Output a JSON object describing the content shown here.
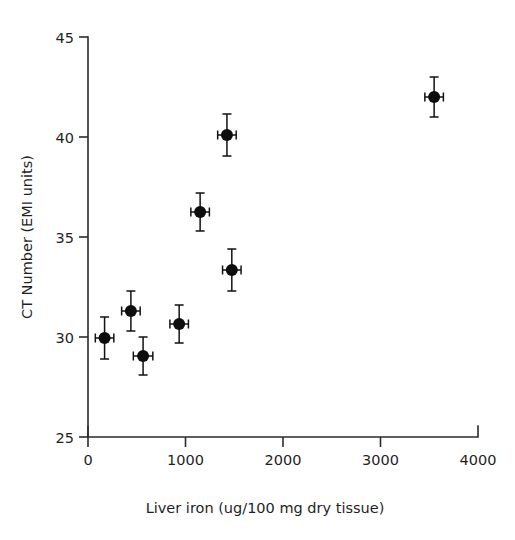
{
  "chart_data": {
    "type": "scatter",
    "title": "",
    "xlabel": "Liver iron (ug/100 mg dry tissue)",
    "ylabel": "CT Number (EMI units)",
    "xlim": [
      0,
      4000
    ],
    "ylim": [
      25,
      45
    ],
    "xticks": [
      0,
      1000,
      2000,
      3000,
      4000
    ],
    "xtick_labels": [
      "0",
      "1000",
      "2000",
      "3000",
      "4000"
    ],
    "yticks": [
      25,
      30,
      35,
      40,
      45
    ],
    "ytick_labels": [
      "25",
      "30",
      "35",
      "40",
      "45"
    ],
    "grid": false,
    "legend": null,
    "marker_style": "filled-circle-with-xy-error-bars",
    "marker_color": "#0d0d0d",
    "axis_color": "#2b2b2b",
    "points": [
      {
        "x": 170,
        "y": 29.95,
        "xerr": 95,
        "yerr": 1.05
      },
      {
        "x": 440,
        "y": 31.3,
        "xerr": 95,
        "yerr": 1.0
      },
      {
        "x": 565,
        "y": 29.05,
        "xerr": 100,
        "yerr": 0.95
      },
      {
        "x": 935,
        "y": 30.65,
        "xerr": 95,
        "yerr": 0.95
      },
      {
        "x": 1150,
        "y": 36.25,
        "xerr": 95,
        "yerr": 0.95
      },
      {
        "x": 1425,
        "y": 40.1,
        "xerr": 95,
        "yerr": 1.05
      },
      {
        "x": 1475,
        "y": 33.35,
        "xerr": 95,
        "yerr": 1.05
      },
      {
        "x": 3550,
        "y": 42.0,
        "xerr": 95,
        "yerr": 1.0
      }
    ]
  }
}
